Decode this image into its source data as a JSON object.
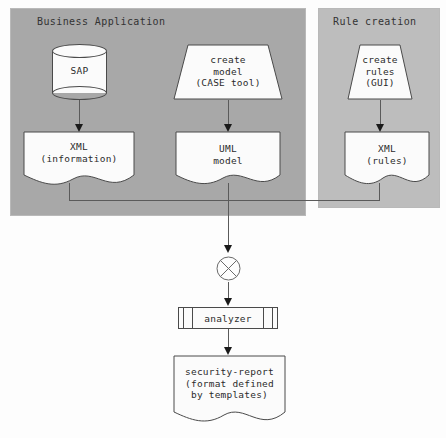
{
  "diagram": {
    "type": "flow-diagram",
    "containers": [
      {
        "id": "business-application",
        "label": "Business Application",
        "fill": "#a8a8a8"
      },
      {
        "id": "rule-creation",
        "label": "Rule creation",
        "fill": "#bdbdbd"
      }
    ],
    "nodes": {
      "sap": {
        "label": "SAP",
        "shape": "cylinder"
      },
      "create_model": {
        "label": "create\nmodel\n(CASE tool)",
        "shape": "trapezoid"
      },
      "create_rules": {
        "label": "create\nrules\n(GUI)",
        "shape": "trapezoid"
      },
      "xml_information": {
        "label": "XML\n(information)",
        "shape": "document"
      },
      "uml_model": {
        "label": "UML\nmodel",
        "shape": "document"
      },
      "xml_rules": {
        "label": "XML\n(rules)",
        "shape": "document"
      },
      "merge": {
        "label": "",
        "shape": "crossed-circle"
      },
      "analyzer": {
        "label": "analyzer",
        "shape": "component"
      },
      "security_report": {
        "label": "security-report\n(format defined\nby templates)",
        "shape": "document"
      }
    },
    "edges": [
      {
        "from": "sap",
        "to": "xml_information"
      },
      {
        "from": "create_model",
        "to": "uml_model"
      },
      {
        "from": "create_rules",
        "to": "xml_rules"
      },
      {
        "from": "xml_information",
        "to": "merge"
      },
      {
        "from": "uml_model",
        "to": "merge"
      },
      {
        "from": "xml_rules",
        "to": "merge"
      },
      {
        "from": "merge",
        "to": "analyzer"
      },
      {
        "from": "analyzer",
        "to": "security_report"
      }
    ],
    "colors": {
      "background": "#fdfdfd",
      "shape_fill": "#fbfbfb",
      "stroke": "#4a4a4a",
      "connector": "#5a5a5a",
      "text": "#2b2b2b"
    }
  }
}
